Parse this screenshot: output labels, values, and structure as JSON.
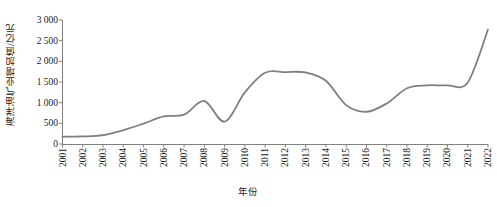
{
  "chart_data": {
    "type": "line",
    "title": "",
    "xlabel": "年份",
    "ylabel": "海洋油气业增加值/亿元",
    "xlim": [
      2001,
      2022
    ],
    "ylim": [
      0,
      3000
    ],
    "grid": false,
    "legend": null,
    "line_color": "#7f7f7f",
    "categories": [
      "2001",
      "2002",
      "2003",
      "2004",
      "2005",
      "2006",
      "2007",
      "2008",
      "2009",
      "2010",
      "2011",
      "2012",
      "2013",
      "2014",
      "2015",
      "2016",
      "2017",
      "2018",
      "2019",
      "2020",
      "2021",
      "2022"
    ],
    "ytick_labels": [
      "0",
      "500",
      "1 000",
      "1 500",
      "2 000",
      "2 500",
      "3 000"
    ],
    "ytick_values": [
      0,
      500,
      1000,
      1500,
      2000,
      2500,
      3000
    ],
    "series": [
      {
        "name": "海洋油气业增加值",
        "values": [
          176,
          183,
          213,
          335,
          494,
          669,
          709,
          1040,
          540,
          1250,
          1724,
          1740,
          1730,
          1530,
          940,
          780,
          980,
          1350,
          1420,
          1420,
          1490,
          2770
        ]
      }
    ]
  }
}
